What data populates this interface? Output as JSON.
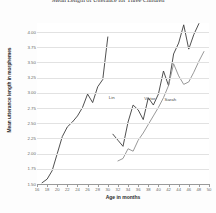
{
  "chart_data": {
    "type": "line",
    "title": "Mean Length of Utterance for Three Children",
    "xlabel": "Age in months",
    "ylabel": "Mean utterance length in morphemes",
    "xlim": [
      16,
      50
    ],
    "ylim": [
      1.5,
      4.15
    ],
    "grid": true,
    "legend_position": "inline-labels",
    "xticks": [
      16,
      18,
      20,
      22,
      24,
      26,
      28,
      30,
      32,
      34,
      36,
      38,
      40,
      42,
      44,
      46,
      48,
      50
    ],
    "ytick_labels": [
      "4.00",
      "3.75",
      "3.50",
      "3.25",
      "3.00",
      "2.75",
      "2.50",
      "2.25",
      "2.00",
      "1.75",
      "1.50"
    ],
    "yticks": [
      4.0,
      3.75,
      3.5,
      3.25,
      3.0,
      2.75,
      2.5,
      2.25,
      2.0,
      1.75,
      1.5
    ],
    "series": [
      {
        "name": "Lin",
        "color": "#3c3c3c",
        "label_x": 30,
        "label_y": 2.92,
        "x": [
          17,
          18,
          19,
          20,
          21,
          22,
          23,
          24,
          25,
          26,
          27,
          28,
          29,
          30
        ],
        "y": [
          1.52,
          1.58,
          1.72,
          2.0,
          2.28,
          2.44,
          2.52,
          2.62,
          2.76,
          2.98,
          2.84,
          3.1,
          3.22,
          3.92
        ]
      },
      {
        "name": "Victor",
        "color": "#3c3c3c",
        "label_x": 37,
        "label_y": 2.9,
        "x": [
          31,
          32,
          33,
          34,
          35,
          36,
          37,
          38,
          39,
          40,
          41,
          42,
          43,
          44,
          45,
          46,
          47,
          48
        ],
        "y": [
          2.32,
          2.22,
          2.12,
          2.52,
          2.8,
          2.72,
          2.56,
          2.92,
          2.8,
          2.98,
          3.36,
          3.12,
          3.64,
          3.82,
          4.12,
          3.72,
          3.96,
          4.14
        ]
      },
      {
        "name": "Sarah",
        "color": "#8c8c8c",
        "label_x": 41,
        "label_y": 2.88,
        "x": [
          32,
          33,
          34,
          35,
          36,
          37,
          38,
          39,
          40,
          41,
          42,
          43,
          44,
          45,
          46,
          47,
          48,
          49
        ],
        "y": [
          1.88,
          1.92,
          2.08,
          2.04,
          2.22,
          2.34,
          2.48,
          2.62,
          2.76,
          2.92,
          3.12,
          3.48,
          3.28,
          3.14,
          3.18,
          3.34,
          3.52,
          3.68
        ]
      }
    ]
  }
}
